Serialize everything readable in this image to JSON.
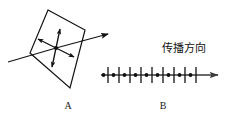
{
  "figure": {
    "background_color": "#ffffff",
    "stroke_color": "#111111",
    "width": 230,
    "height": 124,
    "panels": [
      {
        "id": "A",
        "label": "A",
        "description": "polarizer-plane-with-vibration-arrows"
      },
      {
        "id": "B",
        "label": "B",
        "description": "wave-axis-with-tick-marks-and-dots"
      }
    ]
  },
  "panel_a": {
    "label": "A",
    "plane": {
      "name": "parallelogram-plane",
      "points": "48,10 85,30 70,88 30,53"
    },
    "ray": {
      "name": "incident-ray",
      "start_x": 8,
      "start_y": 62,
      "end_x": 112,
      "end_y": 33
    },
    "vibration_cross": {
      "center_x": 56,
      "center_y": 48,
      "arm_count": 4,
      "double_headed": true
    }
  },
  "panel_b": {
    "label": "B",
    "annotation": "传播方向",
    "axis": {
      "name": "propagation-axis",
      "start_x": 103,
      "end_x": 222,
      "y": 75
    },
    "tick_count": 9,
    "dot_count": 9,
    "tick_positions": [
      108,
      119,
      130,
      141,
      152,
      163,
      174,
      185,
      196
    ],
    "dot_positions": [
      104,
      113,
      124,
      135,
      146,
      157,
      168,
      179,
      190
    ],
    "tick_half_height": 8
  },
  "colors": {
    "stroke": "#111111",
    "axis": "#3a3a3a",
    "background": "#ffffff",
    "text": "#1a1a1a"
  }
}
